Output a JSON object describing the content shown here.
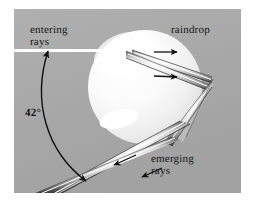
{
  "figure": {
    "background_color": "#a9a9a9",
    "border_color": "#ffffff",
    "labels": {
      "entering_rays": "entering\nrays",
      "raindrop": "raindrop",
      "emerging_rays": "emerging\nrays",
      "angle": "42°"
    },
    "colors": {
      "drop_highlight": "#ffffff",
      "drop_body": "#ededed",
      "ray_light": "#f4f4f4",
      "ray_dark": "#4a4a4a",
      "ink": "#151515"
    }
  },
  "diagram_data": {
    "type": "optics-ray-diagram",
    "subject": "raindrop",
    "angle_deg": 42,
    "sphere": {
      "cx": 145,
      "cy": 87,
      "r": 57
    },
    "elements": [
      {
        "name": "entering-ray-beam",
        "direction": "rightward",
        "arrow_count": 2
      },
      {
        "name": "internal-reflection",
        "location": "right-inner-surface"
      },
      {
        "name": "emerging-ray-beam",
        "direction": "down-left",
        "arrow_count": 2
      },
      {
        "name": "angle-arc",
        "label": "42°",
        "arrow_ends": "both"
      }
    ]
  }
}
